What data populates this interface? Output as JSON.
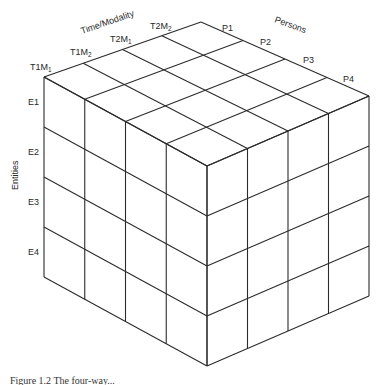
{
  "diagram": {
    "type": "data-cube",
    "axes": {
      "time_modality": {
        "title": "Time/Modality",
        "levels": [
          {
            "main": "T1M",
            "sub": "1"
          },
          {
            "main": "T1M",
            "sub": "2"
          },
          {
            "main": "T2M",
            "sub": "1"
          },
          {
            "main": "T2M",
            "sub": "2"
          }
        ]
      },
      "persons": {
        "title": "Persons",
        "levels": [
          "P1",
          "P2",
          "P3",
          "P4"
        ]
      },
      "entities": {
        "title": "Entities",
        "levels": [
          "E1",
          "E2",
          "E3",
          "E4"
        ]
      }
    },
    "grid_divisions": 4
  },
  "caption": "Figure 1.2   The four-way..."
}
